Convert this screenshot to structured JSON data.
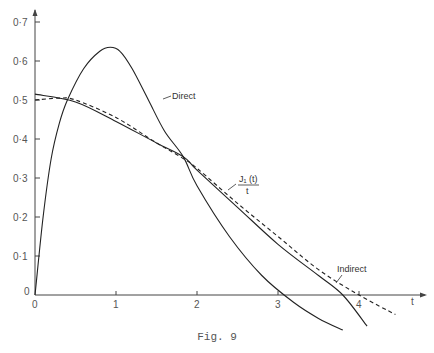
{
  "chart_data": {
    "type": "line",
    "title": "",
    "caption": "Fig. 9",
    "xlabel": "t",
    "ylabel": "",
    "xlim": [
      0,
      4.7
    ],
    "ylim": [
      0,
      0.7
    ],
    "x_ticks": [
      "0",
      "1",
      "2",
      "3",
      "4"
    ],
    "y_ticks": [
      "0",
      "0·1",
      "0·2",
      "0·3",
      "0·4",
      "0·5",
      "0·6",
      "0·7"
    ],
    "grid": false,
    "legend": "inline annotations",
    "series": [
      {
        "name": "Direct",
        "style": "solid",
        "x": [
          0,
          0.1,
          0.2,
          0.3,
          0.4,
          0.6,
          0.8,
          0.93,
          1.05,
          1.2,
          1.4,
          1.6,
          1.83,
          2.0,
          2.4,
          2.8,
          3.2,
          3.5,
          3.8
        ],
        "y": [
          0,
          0.2,
          0.35,
          0.44,
          0.5,
          0.58,
          0.625,
          0.635,
          0.625,
          0.58,
          0.5,
          0.42,
          0.355,
          0.28,
          0.15,
          0.05,
          -0.02,
          -0.06,
          -0.09
        ]
      },
      {
        "name": "J1(t)/t",
        "style": "solid",
        "x": [
          0,
          0.5,
          1.0,
          1.5,
          1.83,
          2.0,
          2.5,
          3.0,
          3.5,
          3.8,
          4.1
        ],
        "y": [
          0.515,
          0.495,
          0.445,
          0.39,
          0.355,
          0.32,
          0.225,
          0.13,
          0.05,
          0.0,
          -0.08
        ]
      },
      {
        "name": "Indirect",
        "style": "dashed",
        "x": [
          0,
          0.3,
          0.5,
          1.0,
          1.5,
          1.83,
          2.0,
          2.5,
          3.0,
          3.5,
          4.0,
          4.45
        ],
        "y": [
          0.5,
          0.505,
          0.5,
          0.455,
          0.39,
          0.35,
          0.325,
          0.235,
          0.15,
          0.065,
          0.0,
          -0.05
        ]
      }
    ],
    "annotations": [
      {
        "text": "Direct",
        "x": 1.6,
        "y": 0.51
      },
      {
        "text": "J₁(t)",
        "sub": "t",
        "x": 2.55,
        "y": 0.29
      },
      {
        "text": "Indirect",
        "x": 3.2,
        "y": 0.08
      }
    ]
  },
  "labels": {
    "direct": "Direct",
    "j1_num": "J₁ (t)",
    "j1_den": "t",
    "indirect": "Indirect",
    "x_axis": "t",
    "caption": "Fig. 9"
  }
}
